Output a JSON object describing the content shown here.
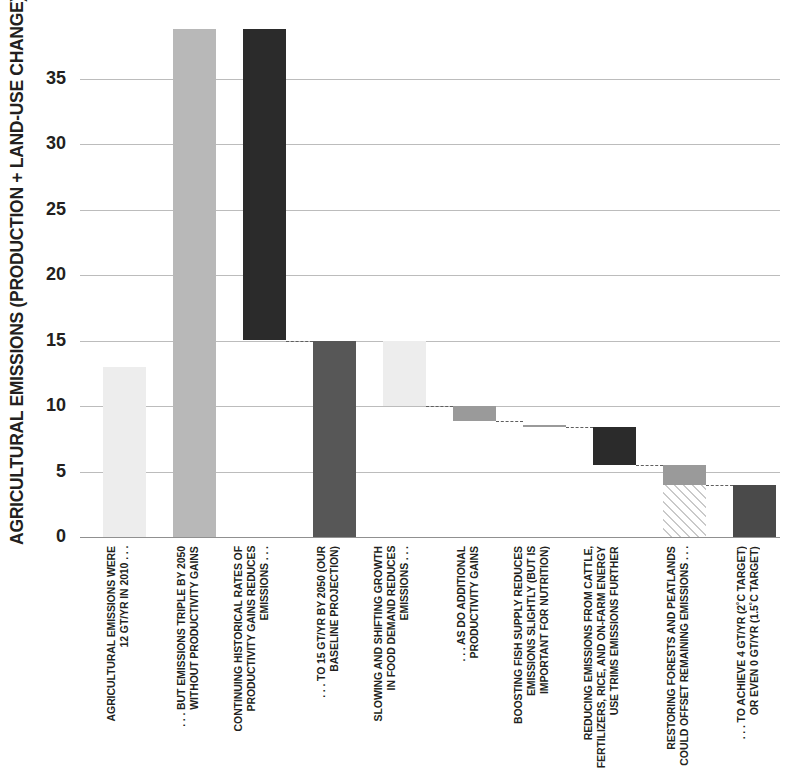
{
  "chart_data": {
    "type": "bar",
    "chart_style": "waterfall",
    "title": "",
    "xlabel": "",
    "ylabel": "AGRICULTURAL EMISSIONS (PRODUCTION + LAND-USE CHANGE)",
    "ylim": [
      0,
      38.8
    ],
    "yticks": [
      0,
      5,
      10,
      15,
      20,
      25,
      30,
      35
    ],
    "ytick_labels": [
      "0",
      "5",
      "10",
      "15",
      "20",
      "25",
      "30",
      "35"
    ],
    "grid": true,
    "legend": false,
    "units": "Gt CO2e/yr",
    "categories": [
      "Agricultural emissions were 12 Gt/yr in 2010",
      "But emissions triple by 2050 without productivity gains",
      "Continuing historical rates of productivity gains reduces emissions",
      "To 15 Gt/yr by 2050 (our baseline projection)",
      "Slowing and shifting growth in food demand reduces emissions",
      "As do additional productivity gains",
      "Boosting fish supply reduces emissions slightly (but is important for nutrition)",
      "Reducing emissions from cattle, fertilizers, rice, and on-farm energy use trims emissions further",
      "Restoring forests and peatlands could offset remaining emissions",
      "To achieve 4 Gt/yr (2 C target) or even 0 Gt/yr (1.5 C target)"
    ],
    "bars": [
      {
        "index": 1,
        "kind": "total",
        "base": 0.0,
        "top": 13.0,
        "value": 12.7,
        "shade": "verylight"
      },
      {
        "index": 2,
        "kind": "total",
        "base": 0.0,
        "top": 38.8,
        "value": 38.8,
        "shade": "midlight"
      },
      {
        "index": 3,
        "kind": "delta",
        "base": 15.0,
        "top": 38.8,
        "value": -23.8,
        "shade": "black"
      },
      {
        "index": 4,
        "kind": "total",
        "base": 0.0,
        "top": 15.0,
        "value": 15.0,
        "shade": "dark"
      },
      {
        "index": 5,
        "kind": "delta",
        "base": 10.0,
        "top": 15.0,
        "value": -5.0,
        "shade": "verylight"
      },
      {
        "index": 6,
        "kind": "delta",
        "base": 8.85,
        "top": 10.0,
        "value": -1.15,
        "shade": "mid"
      },
      {
        "index": 7,
        "kind": "delta",
        "base": 8.4,
        "top": 8.55,
        "value": -0.15,
        "shade": "mid"
      },
      {
        "index": 8,
        "kind": "delta",
        "base": 5.5,
        "top": 8.4,
        "value": -2.9,
        "shade": "black"
      },
      {
        "index": 9,
        "kind": "delta",
        "base": 4.0,
        "top": 5.5,
        "value": -1.5,
        "shade": "mid"
      },
      {
        "index": 10,
        "kind": "total",
        "base": 0.0,
        "top": 4.0,
        "value": 4.0,
        "shade": "darker"
      }
    ],
    "hatched_region": {
      "label": "Additional offset potential to reach 0 Gt/yr (1.5 C target)",
      "column_index": 9,
      "base": 0.0,
      "top": 4.0,
      "style": "diagonal-hatch"
    },
    "connectors": [
      {
        "from_bar": 3,
        "to_bar": 4,
        "level": 15.0
      },
      {
        "from_bar": 5,
        "to_bar": 6,
        "level": 10.0
      },
      {
        "from_bar": 6,
        "to_bar": 7,
        "level": 8.85
      },
      {
        "from_bar": 7,
        "to_bar": 8,
        "level": 8.4
      },
      {
        "from_bar": 8,
        "to_bar": 9,
        "level": 5.5
      },
      {
        "from_bar": 9,
        "to_bar": 10,
        "level": 4.0
      }
    ]
  },
  "axis": {
    "y_title": "AGRICULTURAL EMISSIONS (PRODUCTION + LAND-USE CHANGE)",
    "y_ticks": [
      "35",
      "30",
      "25",
      "20",
      "15",
      "10",
      "5",
      "0"
    ]
  },
  "x_labels": [
    {
      "lines": [
        "AGRICULTURAL EMISSIONS WERE",
        "12 GT/YR IN 2010 . . ."
      ]
    },
    {
      "lines": [
        ". . . BUT EMISSIONS TRIPLE BY 2050",
        "WITHOUT PRODUCTIVITY GAINS"
      ]
    },
    {
      "lines": [
        "CONTINUING HISTORICAL RATES OF",
        "PRODUCTIVITY GAINS REDUCES",
        "EMISSIONS . . ."
      ]
    },
    {
      "lines": [
        ". . . TO 15 GT/YR BY 2050 (OUR",
        "BASELINE PROJECTION)"
      ]
    },
    {
      "lines": [
        "SLOWING AND SHIFTING GROWTH",
        "IN FOOD DEMAND REDUCES",
        "EMISSIONS . . ."
      ]
    },
    {
      "lines": [
        ". . . AS DO ADDITIONAL",
        "PRODUCTIVITY GAINS"
      ]
    },
    {
      "lines": [
        "BOOSTING FISH SUPPLY REDUCES",
        "EMISSIONS SLIGHTLY (BUT IS",
        "IMPORTANT FOR NUTRITION)"
      ]
    },
    {
      "lines": [
        "REDUCING EMISSIONS FROM CATTLE,",
        "FERTILIZERS, RICE, AND ON-FARM ENERGY",
        "USE TRIMS EMISSIONS FURTHER"
      ]
    },
    {
      "lines": [
        "RESTORING FORESTS AND PEATLANDS",
        "COULD OFFSET REMAINING EMISSIONS . . ."
      ]
    },
    {
      "lines": [
        ". . . TO ACHIEVE 4 GT/YR (2˚C TARGET)",
        "OR EVEN 0 GT/YR (1.5˚C TARGET)"
      ]
    }
  ],
  "colors": {
    "verylight": "#ededed",
    "light": "#e2e2e2",
    "midlight": "#b8b8b8",
    "mid": "#9a9a9a",
    "dark": "#575757",
    "darker": "#4a4a4a",
    "black": "#2b2b2b",
    "gridline": "#bcbcbc",
    "text": "#231f20"
  }
}
